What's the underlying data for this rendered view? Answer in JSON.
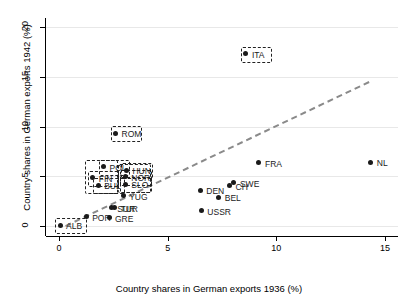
{
  "chart_data": {
    "type": "scatter",
    "title": "",
    "xlabel": "Country shares in German exports 1936 (%)",
    "ylabel": "Country shares in German exports 1942 (%)",
    "xlim": [
      -0.6,
      15.6
    ],
    "ylim": [
      -1.0,
      20.9
    ],
    "xticks": [
      "0",
      "5",
      "10",
      "15"
    ],
    "xtickvals": [
      0,
      5,
      10,
      15
    ],
    "yticks": [
      "0",
      "5",
      "10",
      "15",
      "20"
    ],
    "ytickvals": [
      0,
      5,
      10,
      15,
      20
    ],
    "grid": "horizontal",
    "legend": "none",
    "reference_line": {
      "style": "dashed",
      "color": "#8a8a8a",
      "x": [
        0.3,
        14.3
      ],
      "y": [
        0.0,
        14.5
      ]
    },
    "points": [
      {
        "label": "ALB",
        "x": 0.05,
        "y": 0.1,
        "highlight": true,
        "lx": 6,
        "ly": -4
      },
      {
        "label": "POR",
        "x": 1.25,
        "y": 0.95,
        "highlight": false,
        "lx": 6,
        "ly": -4
      },
      {
        "label": "GRE",
        "x": 2.3,
        "y": 0.85,
        "highlight": false,
        "lx": 6,
        "ly": -4
      },
      {
        "label": "TUR",
        "x": 2.55,
        "y": 1.85,
        "highlight": false,
        "lx": 6,
        "ly": -4
      },
      {
        "label": "SUR",
        "x": 2.4,
        "y": 1.85,
        "highlight": false,
        "lx": 6,
        "ly": -4
      },
      {
        "label": "YUG",
        "x": 2.95,
        "y": 3.05,
        "highlight": false,
        "lx": 6,
        "ly": -4
      },
      {
        "label": "BUL",
        "x": 1.8,
        "y": 4.1,
        "highlight": true,
        "lx": 6,
        "ly": -4
      },
      {
        "label": "SLO",
        "x": 3.05,
        "y": 4.2,
        "highlight": true,
        "lx": 6,
        "ly": -4
      },
      {
        "label": "FIN",
        "x": 1.55,
        "y": 4.85,
        "highlight": true,
        "lx": 6,
        "ly": -4
      },
      {
        "label": "NOR",
        "x": 3.05,
        "y": 4.95,
        "highlight": true,
        "lx": 6,
        "ly": -4
      },
      {
        "label": "POL",
        "x": 2.05,
        "y": 5.95,
        "highlight": true,
        "lx": 6,
        "ly": -4
      },
      {
        "label": "HUN",
        "x": 3.1,
        "y": 5.6,
        "highlight": true,
        "lx": 6,
        "ly": -4
      },
      {
        "label": "ROM",
        "x": 2.6,
        "y": 9.3,
        "highlight": true,
        "lx": 6,
        "ly": -4
      },
      {
        "label": "ITA",
        "x": 8.6,
        "y": 17.3,
        "highlight": true,
        "lx": 6,
        "ly": -4
      },
      {
        "label": "USSR",
        "x": 6.55,
        "y": 1.55,
        "highlight": false,
        "lx": 6,
        "ly": -4
      },
      {
        "label": "BEL",
        "x": 7.35,
        "y": 2.9,
        "highlight": false,
        "lx": 6,
        "ly": -4
      },
      {
        "label": "DEN",
        "x": 6.5,
        "y": 3.6,
        "highlight": false,
        "lx": 6,
        "ly": -4
      },
      {
        "label": "CH",
        "x": 7.85,
        "y": 4.05,
        "highlight": false,
        "lx": 6,
        "ly": -4
      },
      {
        "label": "SWE",
        "x": 8.05,
        "y": 4.35,
        "highlight": false,
        "lx": 6,
        "ly": -4
      },
      {
        "label": "FRA",
        "x": 9.2,
        "y": 6.35,
        "highlight": false,
        "lx": 6,
        "ly": -4
      },
      {
        "label": "NL",
        "x": 14.35,
        "y": 6.4,
        "highlight": false,
        "lx": 6,
        "ly": -4
      }
    ],
    "highlight_groups": [
      {
        "name": "pol-fin-bul-group",
        "x0": 1.18,
        "x1": 2.62,
        "y0": 3.4,
        "y1": 6.6
      },
      {
        "name": "hun-nor-slo-group",
        "x0": 2.7,
        "x1": 4.15,
        "y0": 3.55,
        "y1": 6.2
      }
    ]
  }
}
